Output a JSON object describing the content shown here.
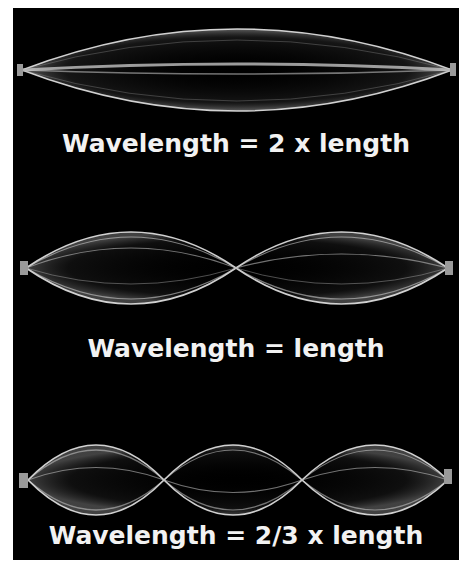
{
  "figure": {
    "background": "#000000",
    "string_color": "#e8e8e8",
    "harmonics": [
      {
        "label": "Wavelength = 2 x length",
        "loops": 1
      },
      {
        "label": "Wavelength = length",
        "loops": 2
      },
      {
        "label": "Wavelength = 2/3 x length",
        "loops": 3
      }
    ]
  }
}
